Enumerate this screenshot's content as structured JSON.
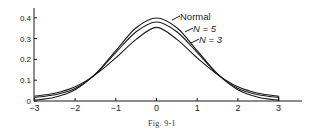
{
  "chart_data": {
    "type": "line",
    "title": "",
    "caption": "Fig. 9-1",
    "xlabel": "",
    "ylabel": "",
    "xlim": [
      -3,
      3.5
    ],
    "ylim": [
      0,
      0.45
    ],
    "grid": false,
    "x_ticks": [
      "-3",
      "-2",
      "-1",
      "0",
      "1",
      "2",
      "3"
    ],
    "y_ticks": [
      "0",
      "0.1",
      "0.2",
      "0.3",
      "0.4"
    ],
    "legend_position": "inline annotations near peak, upper right",
    "series": [
      {
        "name": "Normal",
        "x": [
          -3,
          -2.5,
          -2,
          -1.5,
          -1,
          -0.5,
          0,
          0.5,
          1,
          1.5,
          2,
          2.5,
          3
        ],
        "values": [
          0.004,
          0.018,
          0.054,
          0.13,
          0.242,
          0.352,
          0.399,
          0.352,
          0.242,
          0.13,
          0.054,
          0.018,
          0.004
        ]
      },
      {
        "name": "N=5",
        "x": [
          -3,
          -2.5,
          -2,
          -1.5,
          -1,
          -0.5,
          0,
          0.5,
          1,
          1.5,
          2,
          2.5,
          3
        ],
        "values": [
          0.017,
          0.03,
          0.06,
          0.129,
          0.233,
          0.333,
          0.38,
          0.333,
          0.233,
          0.129,
          0.06,
          0.03,
          0.017
        ]
      },
      {
        "name": "N=3",
        "x": [
          -3,
          -2.5,
          -2,
          -1.5,
          -1,
          -0.5,
          0,
          0.5,
          1,
          1.5,
          2,
          2.5,
          3
        ],
        "values": [
          0.023,
          0.037,
          0.068,
          0.127,
          0.207,
          0.296,
          0.354,
          0.296,
          0.207,
          0.127,
          0.068,
          0.037,
          0.023
        ]
      }
    ],
    "annotations": [
      "Normal",
      "N = 5",
      "N = 3"
    ]
  },
  "labels": {
    "normal": "Normal",
    "n5": "N = 5",
    "n3": "N = 3",
    "caption": "Fig. 9-1"
  }
}
